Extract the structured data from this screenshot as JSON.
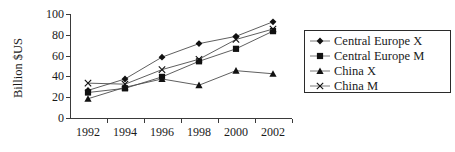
{
  "chart_data": {
    "type": "line",
    "title": "",
    "xlabel": "",
    "ylabel": "Billion $US",
    "x": [
      1992,
      1994,
      1996,
      1998,
      2000,
      2002
    ],
    "xtick_labels": [
      "1992",
      "1994",
      "1996",
      "1998",
      "2000",
      "2002"
    ],
    "ytick_labels": [
      "0",
      "20",
      "40",
      "60",
      "80",
      "100"
    ],
    "ytick_values": [
      0,
      20,
      40,
      60,
      80,
      100
    ],
    "ylim": [
      0,
      100
    ],
    "xlim": [
      1991,
      2003
    ],
    "grid": false,
    "legend_position": "right",
    "series": [
      {
        "name": "Central Europe X",
        "marker": "diamond",
        "values": [
          27,
          38,
          59,
          72,
          79,
          93
        ]
      },
      {
        "name": "Central Europe M",
        "marker": "square",
        "values": [
          25,
          29,
          40,
          55,
          67,
          84
        ]
      },
      {
        "name": "China X",
        "marker": "triangle",
        "values": [
          19,
          30,
          38,
          32,
          46,
          43
        ]
      },
      {
        "name": "China M",
        "marker": "cross",
        "values": [
          34,
          33,
          47,
          57,
          76,
          86
        ]
      }
    ]
  },
  "axis": {
    "y_title": "Billion $US"
  },
  "legend": {
    "entries": [
      {
        "label": "Central Europe X",
        "marker": "diamond-marker"
      },
      {
        "label": "Central Europe M",
        "marker": "square-marker"
      },
      {
        "label": "China X",
        "marker": "triangle-marker"
      },
      {
        "label": "China M",
        "marker": "cross-marker"
      }
    ]
  },
  "colors": {
    "ink": "#111111",
    "line": "#4d4d4d",
    "axis": "#3a3a3a",
    "background": "#ffffff"
  }
}
